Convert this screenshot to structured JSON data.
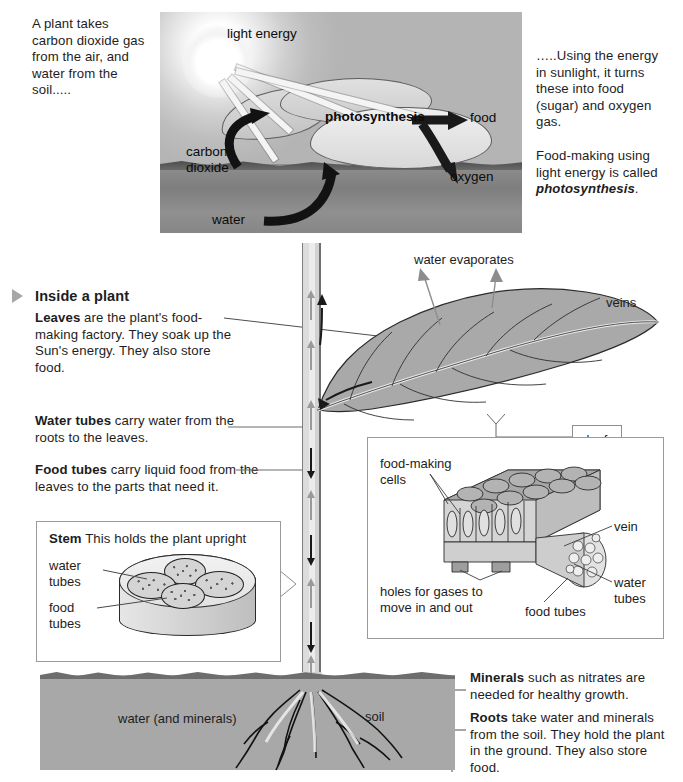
{
  "top_panel": {
    "left_text": "A plant takes carbon dioxide gas from the air, and water from the soil.....",
    "photo_labels": {
      "light_energy": "light energy",
      "photosynthesis": "photosynthesis",
      "food": "food",
      "oxygen": "oxygen",
      "carbon_dioxide": "carbon dioxide",
      "water": "water"
    },
    "right_text_1": "…..Using the energy in sunlight, it turns these into food (sugar) and oxygen gas.",
    "right_text_2_plain": "Food-making using light energy is called ",
    "right_text_2_term": "photosynthesis",
    "right_text_2_end": "."
  },
  "section": {
    "bullet_icon": "triangle-right-icon",
    "heading": "Inside a plant",
    "blocks": [
      {
        "term": "Leaves",
        "body": " are the plant's food-making factory. They soak up the Sun's energy. They also store food."
      },
      {
        "term": "Water tubes",
        "body": " carry water from the roots to the leaves."
      },
      {
        "term": "Food tubes",
        "body": " carry liquid food from the leaves to the parts that need it."
      }
    ]
  },
  "diagram_labels": {
    "water_evaporates": "water evaporates",
    "veins": "veins",
    "soil": "soil",
    "water_and_minerals": "water (and minerals)"
  },
  "stem_box": {
    "term": "Stem",
    "title_rest": " This holds the plant upright",
    "labels": {
      "water_tubes": "water\ntubes",
      "food_tubes": "food\ntubes"
    }
  },
  "leaf_box": {
    "badge": "leaf",
    "labels": {
      "food_making_cells": "food-making\ncells",
      "vein": "vein",
      "water_tubes": "water\ntubes",
      "food_tubes": "food tubes",
      "holes": "holes for gases to\nmove in and out"
    }
  },
  "bottom_blocks": [
    {
      "term": "Minerals",
      "body": " such as nitrates are needed for healthy growth."
    },
    {
      "term": "Roots",
      "body": " take water and minerals from the soil. They hold the plant in the ground. They also store food."
    }
  ],
  "colors": {
    "ink": "#1d1d1d",
    "soil": "#a8a8a8",
    "leaf_fill": "#a9a9a9",
    "arrow_up": "#9a9a9a",
    "arrow_down": "#1a1a1a",
    "box_border": "#9a9a9a"
  }
}
